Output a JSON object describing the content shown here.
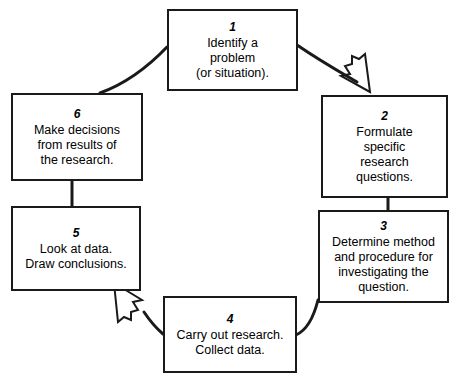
{
  "diagram": {
    "type": "cyclic-process",
    "stroke_color": "#1a1a1a",
    "background_color": "#ffffff",
    "nodes": [
      {
        "id": "1",
        "number": "1",
        "text": "Identify a\nproblem\n(or situation)."
      },
      {
        "id": "2",
        "number": "2",
        "text": "Formulate\nspecific\nresearch\nquestions."
      },
      {
        "id": "3",
        "number": "3",
        "text": "Determine method\nand procedure for\ninvestigating the\nquestion."
      },
      {
        "id": "4",
        "number": "4",
        "text": "Carry out research.\nCollect data."
      },
      {
        "id": "5",
        "number": "5",
        "text": "Look at data.\nDraw conclusions."
      },
      {
        "id": "6",
        "number": "6",
        "text": "Make decisions\nfrom results of\nthe research."
      }
    ],
    "connectors": [
      {
        "id": "c1",
        "from": "1",
        "to": "2",
        "style": "curved",
        "arrowhead": "open"
      },
      {
        "id": "c2",
        "from": "2",
        "to": "3",
        "style": "straight",
        "arrowhead": "none"
      },
      {
        "id": "c3",
        "from": "3",
        "to": "4",
        "style": "curved",
        "arrowhead": "none"
      },
      {
        "id": "c4",
        "from": "4",
        "to": "5",
        "style": "curved",
        "arrowhead": "open"
      },
      {
        "id": "c5",
        "from": "5",
        "to": "6",
        "style": "straight",
        "arrowhead": "none"
      },
      {
        "id": "c6",
        "from": "6",
        "to": "1",
        "style": "curved",
        "arrowhead": "none"
      }
    ]
  }
}
